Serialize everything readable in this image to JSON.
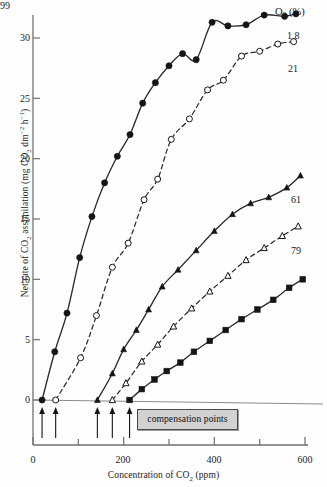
{
  "chart_data": {
    "type": "line",
    "title": "",
    "xlabel": "Concentration of CO₂ (ppm)",
    "ylabel": "Net rate of CO₂ assimilation (mg CO₂ dm⁻² h⁻¹)",
    "xlim": [
      0,
      600
    ],
    "ylim": [
      0,
      33
    ],
    "xticks": [
      0,
      200,
      400,
      600
    ],
    "xtick_labels": [
      "0",
      "200",
      "400",
      "600"
    ],
    "yticks": [
      0,
      5,
      10,
      15,
      20,
      25,
      30
    ],
    "ytick_labels": [
      "0",
      "5",
      "10",
      "15",
      "20",
      "25",
      "30"
    ],
    "grid": false,
    "legend_position": "right-of-curves",
    "legend_title": "O₂ (%)",
    "annotations": [
      {
        "text": "compensation points",
        "kind": "boxed-label",
        "points_to": "x-axis arrows"
      }
    ],
    "compensation_points": [
      20,
      50,
      142,
      175,
      213
    ],
    "series": [
      {
        "name": "1.8",
        "marker": "filled-circle",
        "linestyle": "solid",
        "compensation_point": 20,
        "x": [
          20,
          48,
          75,
          103,
          130,
          158,
          186,
          214,
          242,
          270,
          300,
          330,
          360,
          395,
          430,
          470,
          510,
          555,
          580
        ],
        "y": [
          0,
          4.0,
          7.2,
          11.8,
          15.2,
          18.0,
          20.2,
          22.0,
          24.6,
          26.3,
          27.7,
          28.7,
          28.2,
          31.3,
          31.0,
          31.1,
          31.9,
          31.8,
          32.0
        ]
      },
      {
        "name": "21",
        "marker": "open-circle",
        "linestyle": "dashed",
        "compensation_point": 50,
        "x": [
          50,
          105,
          140,
          175,
          210,
          245,
          275,
          305,
          345,
          385,
          420,
          460,
          500,
          540,
          575
        ],
        "y": [
          0,
          3.5,
          7.0,
          11.0,
          13.0,
          16.6,
          18.3,
          21.6,
          23.3,
          25.7,
          26.5,
          28.5,
          28.9,
          29.5,
          29.7
        ]
      },
      {
        "name": "61",
        "marker": "filled-triangle",
        "linestyle": "solid",
        "compensation_point": 142,
        "x": [
          142,
          175,
          200,
          228,
          255,
          285,
          320,
          360,
          400,
          440,
          480,
          520,
          560,
          590
        ],
        "y": [
          0,
          2.2,
          4.2,
          5.8,
          7.5,
          9.4,
          10.8,
          12.4,
          14.0,
          15.4,
          16.3,
          16.8,
          17.6,
          18.6
        ]
      },
      {
        "name": "79",
        "marker": "open-triangle",
        "linestyle": "dashed",
        "compensation_point": 175,
        "x": [
          175,
          205,
          240,
          275,
          310,
          350,
          390,
          430,
          470,
          510,
          550,
          585
        ],
        "y": [
          0,
          1.4,
          3.2,
          4.6,
          6.1,
          7.6,
          9.0,
          10.3,
          11.6,
          12.6,
          13.6,
          14.4
        ]
      },
      {
        "name": "99",
        "marker": "filled-square",
        "linestyle": "solid",
        "compensation_point": 213,
        "x": [
          213,
          240,
          268,
          295,
          325,
          355,
          390,
          425,
          460,
          495,
          530,
          565,
          595
        ],
        "y": [
          0,
          0.9,
          1.7,
          2.4,
          3.1,
          4.0,
          4.9,
          5.8,
          6.7,
          7.5,
          8.3,
          9.3,
          10.0
        ]
      }
    ]
  },
  "legend": {
    "header": "O₂ (%)",
    "labels": [
      "1.8",
      "21",
      "61",
      "79",
      "99"
    ]
  },
  "annotation_box": {
    "label": "compensation points"
  },
  "axes": {
    "x_title": "Concentration of CO₂ (ppm)",
    "y_title": "Net rate of CO₂ assimilation (mg CO₂ dm⁻² h⁻¹)"
  }
}
